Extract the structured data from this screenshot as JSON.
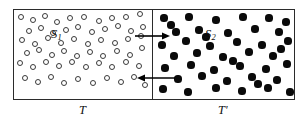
{
  "figure": {
    "type": "physics-diagram",
    "background_color": "#ffffff",
    "line_color": "#2b2b2b"
  },
  "frame": {
    "x": 13,
    "y": 9,
    "width": 282,
    "height": 91,
    "border_width": 1.4
  },
  "divider": {
    "x": 152,
    "y": 9,
    "height": 91,
    "width": 1.4
  },
  "left_chamber": {
    "name": "left-chamber",
    "system_label": "S",
    "system_subscript": "1",
    "temperature_label": "T",
    "particle_style": "open",
    "particle_color": "#3a3a3a",
    "particle_fill": "#ffffff",
    "particle_radius": 3.4,
    "particle_count": 58,
    "particles": [
      [
        21,
        17
      ],
      [
        33,
        20
      ],
      [
        45,
        16
      ],
      [
        57,
        22
      ],
      [
        70,
        18
      ],
      [
        84,
        17
      ],
      [
        99,
        21
      ],
      [
        112,
        18
      ],
      [
        126,
        17
      ],
      [
        140,
        14
      ],
      [
        29,
        31
      ],
      [
        41,
        28
      ],
      [
        53,
        33
      ],
      [
        66,
        30
      ],
      [
        78,
        27
      ],
      [
        92,
        32
      ],
      [
        105,
        29
      ],
      [
        118,
        26
      ],
      [
        131,
        31
      ],
      [
        143,
        27
      ],
      [
        22,
        40
      ],
      [
        35,
        44
      ],
      [
        48,
        38
      ],
      [
        61,
        43
      ],
      [
        74,
        39
      ],
      [
        88,
        44
      ],
      [
        101,
        40
      ],
      [
        115,
        43
      ],
      [
        128,
        39
      ],
      [
        141,
        36
      ],
      [
        27,
        53
      ],
      [
        39,
        50
      ],
      [
        52,
        55
      ],
      [
        64,
        51
      ],
      [
        77,
        56
      ],
      [
        90,
        52
      ],
      [
        103,
        56
      ],
      [
        117,
        51
      ],
      [
        130,
        55
      ],
      [
        142,
        48
      ],
      [
        20,
        63
      ],
      [
        33,
        67
      ],
      [
        46,
        62
      ],
      [
        59,
        66
      ],
      [
        72,
        62
      ],
      [
        86,
        67
      ],
      [
        99,
        63
      ],
      [
        112,
        67
      ],
      [
        126,
        62
      ],
      [
        139,
        66
      ],
      [
        25,
        78
      ],
      [
        38,
        82
      ],
      [
        51,
        77
      ],
      [
        64,
        83
      ],
      [
        78,
        79
      ],
      [
        93,
        83
      ],
      [
        107,
        78
      ],
      [
        121,
        82
      ],
      [
        134,
        77
      ],
      [
        145,
        85
      ]
    ]
  },
  "right_chamber": {
    "name": "right-chamber",
    "system_label": "S",
    "system_subscript": "2",
    "temperature_label": "T",
    "temperature_prime": "'",
    "particle_style": "filled",
    "particle_color": "#0a0a0a",
    "particle_radius": 3.6,
    "particle_count": 44,
    "particles": [
      [
        164,
        18
      ],
      [
        189,
        17
      ],
      [
        216,
        20
      ],
      [
        243,
        17
      ],
      [
        269,
        18
      ],
      [
        286,
        22
      ],
      [
        176,
        32
      ],
      [
        199,
        30
      ],
      [
        228,
        33
      ],
      [
        255,
        29
      ],
      [
        279,
        32
      ],
      [
        162,
        45
      ],
      [
        186,
        41
      ],
      [
        210,
        46
      ],
      [
        237,
        42
      ],
      [
        262,
        45
      ],
      [
        288,
        41
      ],
      [
        174,
        56
      ],
      [
        197,
        53
      ],
      [
        223,
        57
      ],
      [
        249,
        52
      ],
      [
        273,
        56
      ],
      [
        165,
        68
      ],
      [
        191,
        65
      ],
      [
        214,
        70
      ],
      [
        240,
        66
      ],
      [
        266,
        69
      ],
      [
        287,
        64
      ],
      [
        178,
        79
      ],
      [
        202,
        76
      ],
      [
        227,
        81
      ],
      [
        252,
        77
      ],
      [
        277,
        80
      ],
      [
        163,
        89
      ],
      [
        188,
        92
      ],
      [
        216,
        88
      ],
      [
        242,
        91
      ],
      [
        268,
        88
      ],
      [
        290,
        92
      ],
      [
        206,
        37
      ],
      [
        233,
        61
      ],
      [
        258,
        84
      ],
      [
        171,
        25
      ],
      [
        281,
        49
      ]
    ]
  },
  "arrows": [
    {
      "name": "arrow-right",
      "direction": "right",
      "x1": 135,
      "y1": 36,
      "x2": 170,
      "y2": 36,
      "color": "#000000"
    },
    {
      "name": "arrow-left",
      "direction": "left",
      "x1": 175,
      "y1": 78,
      "x2": 137,
      "y2": 78,
      "color": "#000000"
    }
  ]
}
